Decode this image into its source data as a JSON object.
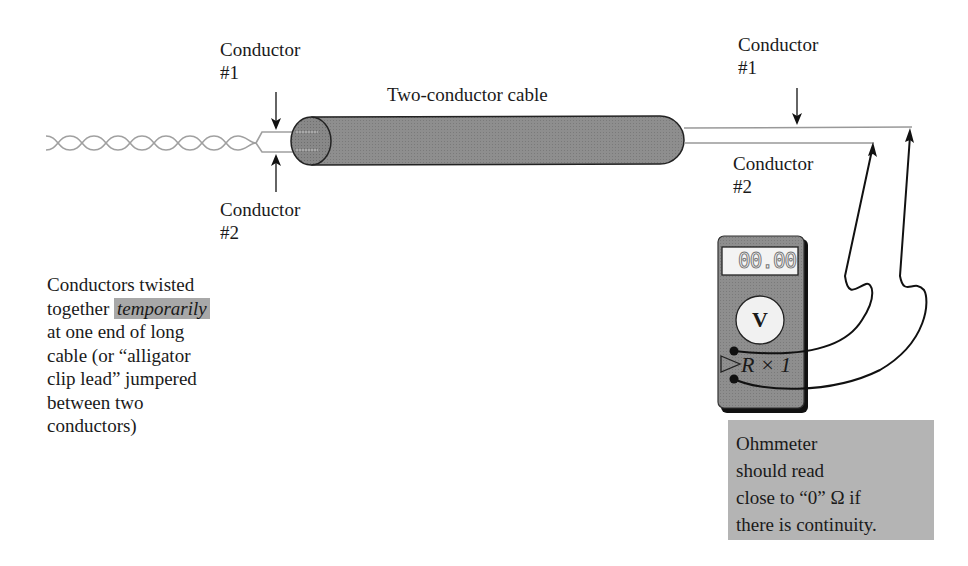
{
  "labels": {
    "conductor1_left": {
      "line1": "Conductor",
      "line2": "#1"
    },
    "conductor2_left": {
      "line1": "Conductor",
      "line2": "#2"
    },
    "conductor1_right": {
      "line1": "Conductor",
      "line2": "#1"
    },
    "conductor2_right": {
      "line1": "Conductor",
      "line2": "#2"
    },
    "cable": "Two-conductor cable"
  },
  "twisted_note": {
    "line1": "Conductors twisted",
    "line2_pre": "together ",
    "line2_emph": "temporarily",
    "line3": "at one end of long",
    "line4": "cable (or “alligator",
    "line5": "clip lead” jumpered",
    "line6": "between two",
    "line7": "conductors)"
  },
  "meter": {
    "display": "00.00",
    "dial_label": "V",
    "range_label": "R × 1"
  },
  "callout": {
    "line1": "Ohmmeter",
    "line2": "should read",
    "line3": "close to “0” Ω if",
    "line4": "there is continuity."
  },
  "colors": {
    "cable_fill": "#8c8c8c",
    "meter_body": "#8a8a8a",
    "callout_bg": "#b4b4b4",
    "highlight_bg": "#a8a8a8",
    "wire": "#9a9a9a",
    "ink": "#1a1a1a"
  }
}
